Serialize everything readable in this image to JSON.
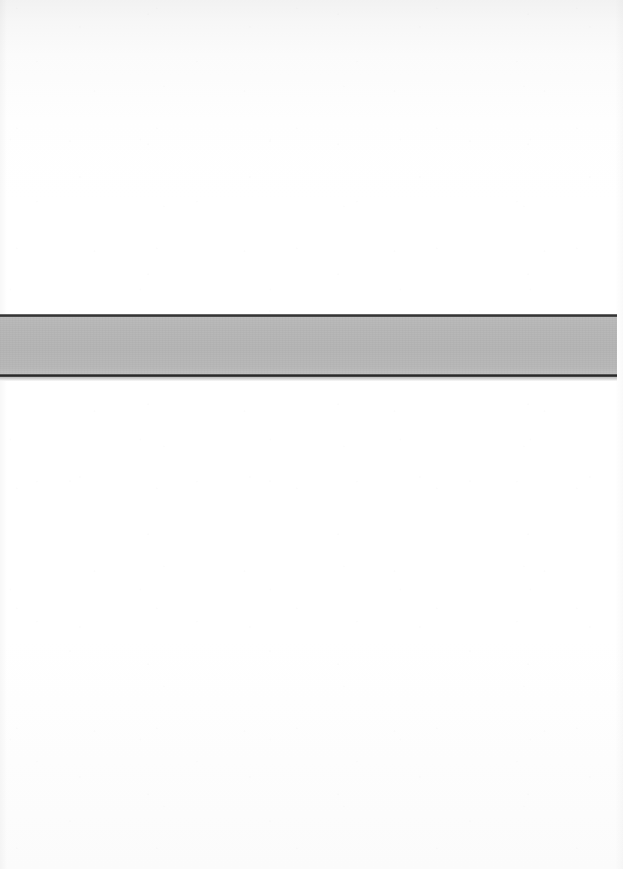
{
  "page": {
    "width": 623,
    "height": 869,
    "background_color": "#ffffff",
    "description": "Blank scanned document page with a single horizontal gray band"
  },
  "band": {
    "name": "horizontal-gray-band",
    "fill_color": "#b4b4b4",
    "rule_color": "#2e2e2e",
    "top": 313,
    "left": 0,
    "width": 617,
    "height": 68,
    "label": ""
  },
  "content": {
    "upper_region_text": "",
    "lower_region_text": "",
    "band_text": ""
  }
}
